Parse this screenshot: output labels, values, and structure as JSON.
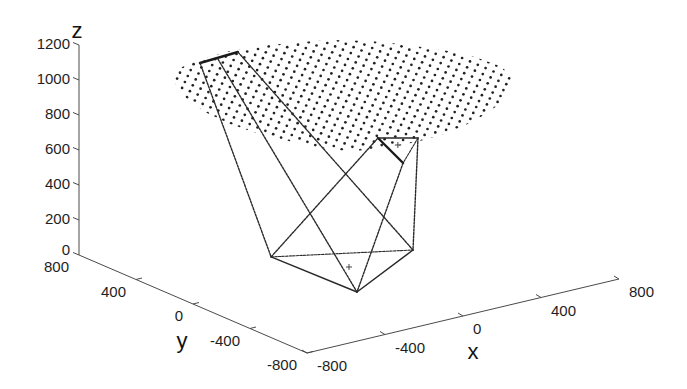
{
  "chart_data": {
    "type": "scatter",
    "projection": "3d",
    "title": "",
    "xlabel": "x",
    "ylabel": "y",
    "zlabel": "z",
    "xlim": [
      -800,
      800
    ],
    "ylim": [
      -800,
      800
    ],
    "zlim": [
      0,
      1200
    ],
    "xticks": [
      -800,
      -400,
      0,
      400,
      800
    ],
    "yticks": [
      800,
      400,
      0,
      -400,
      -800
    ],
    "zticks": [
      0,
      200,
      400,
      600,
      800,
      1000,
      1200
    ],
    "grid": false,
    "legend": null,
    "workspace": {
      "name": "workspace points",
      "marker": "dot",
      "pattern": "regular xy grid (disk)",
      "center_approx": [
        -15,
        30
      ],
      "z_approx": 1000,
      "radius_approx": 700,
      "grid_step_approx": 55
    },
    "points": {
      "B1": [
        -180,
        300,
        0
      ],
      "B2": [
        342,
        19,
        0
      ],
      "B3": [
        -166,
        -283,
        0
      ],
      "P1": [
        213,
        88,
        650
      ],
      "P2": [
        345,
        -12,
        650
      ],
      "P3": [
        104,
        -237,
        650
      ],
      "U1": [
        -404,
        493,
        1100
      ],
      "U2": [
        -314,
        490,
        1100
      ],
      "U3": [
        -194,
        514,
        1100
      ]
    },
    "segments": [
      {
        "group": "base",
        "from": "B1",
        "to": "B3",
        "style": "solid"
      },
      {
        "group": "base",
        "from": "B3",
        "to": "B2",
        "style": "solid"
      },
      {
        "group": "base",
        "from": "B1",
        "to": "B2",
        "style": "thin"
      },
      {
        "group": "platform-lower",
        "from": "P1",
        "to": "P2",
        "style": "solid"
      },
      {
        "group": "platform-lower",
        "from": "P1",
        "to": "P3",
        "style": "bold"
      },
      {
        "group": "platform-lower",
        "from": "P2",
        "to": "P3",
        "style": "thin"
      },
      {
        "group": "platform-upper",
        "from": "U1",
        "to": "U3",
        "style": "bold"
      },
      {
        "group": "cable",
        "from": "U1",
        "to": "B1",
        "style": "dashed"
      },
      {
        "group": "cable",
        "from": "U2",
        "to": "B3",
        "style": "dashed"
      },
      {
        "group": "cable",
        "from": "U3",
        "to": "B2",
        "style": "dashed"
      },
      {
        "group": "cable",
        "from": "P1",
        "to": "B1",
        "style": "dashed"
      },
      {
        "group": "cable",
        "from": "P3",
        "to": "B3",
        "style": "dashed"
      },
      {
        "group": "cable",
        "from": "P2",
        "to": "B2",
        "style": "dashed"
      }
    ],
    "annotations": [
      {
        "marker": "+",
        "label": "base center",
        "at": [
          0,
          0,
          0
        ]
      },
      {
        "marker": "+",
        "label": "platform center",
        "at": [
          225,
          -35,
          650
        ]
      }
    ]
  }
}
